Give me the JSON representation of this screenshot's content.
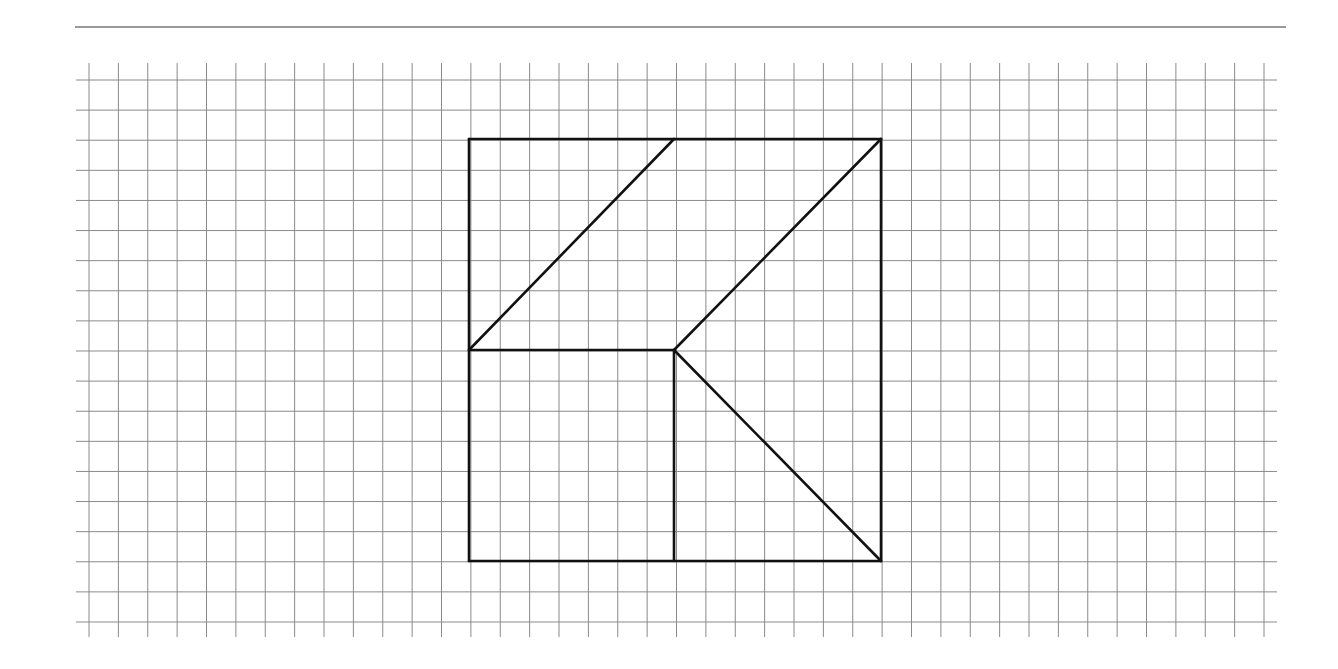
{
  "figure": {
    "top_rule": {
      "x1": 75,
      "x2": 1286,
      "y": 27,
      "color": "#777777"
    },
    "grid": {
      "color": "#8a8a8a",
      "vertical": {
        "x_start": 89,
        "spacing": 29.375,
        "count": 41,
        "y_top": 63,
        "y_bottom": 637
      },
      "horizontal": {
        "y_start": 80,
        "spacing": 30.111,
        "count": 19,
        "x_left": 76,
        "x_right": 1277
      }
    },
    "shape": {
      "stroke": "#111111",
      "stroke_width": 2.6,
      "grid_units": {
        "side": 14,
        "origin_col": 13,
        "origin_row": 2
      },
      "segments": [
        {
          "name": "square-top-edge",
          "x1": 469,
          "y1": 139,
          "x2": 881,
          "y2": 139
        },
        {
          "name": "square-right-edge",
          "x1": 881,
          "y1": 139,
          "x2": 881,
          "y2": 561
        },
        {
          "name": "square-bottom-edge",
          "x1": 469,
          "y1": 561,
          "x2": 881,
          "y2": 561
        },
        {
          "name": "square-left-edge",
          "x1": 469,
          "y1": 139,
          "x2": 469,
          "y2": 561
        },
        {
          "name": "left-diagonal",
          "x1": 469,
          "y1": 350,
          "x2": 674,
          "y2": 139
        },
        {
          "name": "middle-horizontal",
          "x1": 469,
          "y1": 350,
          "x2": 674,
          "y2": 350
        },
        {
          "name": "upper-right-diagonal",
          "x1": 674,
          "y1": 350,
          "x2": 881,
          "y2": 139
        },
        {
          "name": "lower-right-diagonal",
          "x1": 674,
          "y1": 350,
          "x2": 881,
          "y2": 561
        },
        {
          "name": "middle-vertical",
          "x1": 674,
          "y1": 350,
          "x2": 674,
          "y2": 561
        }
      ]
    }
  }
}
